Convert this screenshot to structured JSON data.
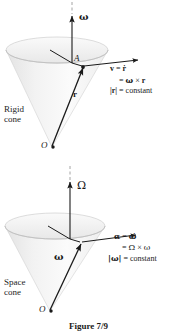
{
  "figure": {
    "caption": "Figure 7/9",
    "background_color": "#ffffff",
    "ink_color": "#1a1a1a",
    "cone_fill": "#f0f0f0"
  },
  "top_panel": {
    "name": "rigid-cone-panel",
    "cone_label_line1": "Rigid",
    "cone_label_line2": "cone",
    "axis_label": "ω",
    "point_a_label": "A",
    "point_o_label": "O",
    "radius_vector_label": "r",
    "equations": [
      "v = ṙ",
      "= ω × r",
      "|r| = constant"
    ],
    "eq_line1_lhs": "v",
    "eq_line1_eq": "=",
    "eq_line1_rhs": "ṙ",
    "eq_line2_eq": "=",
    "eq_line2_rhs_omega": "ω",
    "eq_line2_times": "×",
    "eq_line2_rhs_r": "r",
    "eq_line3_lhs": "|r|",
    "eq_line3_eq": "=",
    "eq_line3_rhs": "constant"
  },
  "bottom_panel": {
    "name": "space-cone-panel",
    "cone_label_line1": "Space",
    "cone_label_line2": "cone",
    "axis_label": "Ω",
    "point_o_label": "O",
    "omega_vector_label": "ω",
    "equations": [
      "α = ω̇",
      "= Ω × ω",
      "|ω| = constant"
    ],
    "eq_line1_lhs": "α",
    "eq_line1_eq": "=",
    "eq_line1_rhs": "ω̇",
    "eq_line2_eq": "=",
    "eq_line2_rhs_omega_cap": "Ω",
    "eq_line2_times": "×",
    "eq_line2_rhs_omega": "ω",
    "eq_line3_lhs": "|ω|",
    "eq_line3_eq": "=",
    "eq_line3_rhs": "constant"
  }
}
